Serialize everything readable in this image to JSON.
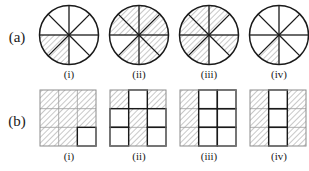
{
  "figure": {
    "kind": "fraction-shading-diagram",
    "background_color": "#ffffff",
    "stroke_color": "#1a1a1a",
    "hatch_color": "#9a9a9a",
    "rows": [
      {
        "label": "(a)",
        "shape": "circle",
        "total_parts": 8,
        "items": [
          {
            "caption": "(i)",
            "shaded_parts": 2,
            "fraction": "2/8",
            "shaded_sectors": [
              4,
              5
            ]
          },
          {
            "caption": "(ii)",
            "shaded_parts": 7,
            "fraction": "7/8",
            "shaded_sectors": [
              0,
              1,
              2,
              3,
              5,
              6,
              7
            ]
          },
          {
            "caption": "(iii)",
            "shaded_parts": 6,
            "fraction": "6/8",
            "shaded_sectors": [
              1,
              2,
              3,
              4,
              5,
              7
            ]
          },
          {
            "caption": "(iv)",
            "shaded_parts": 1,
            "fraction": "1/8",
            "shaded_sectors": [
              5
            ]
          }
        ]
      },
      {
        "label": "(b)",
        "shape": "square-grid",
        "grid_rows": 3,
        "grid_cols": 3,
        "total_parts": 9,
        "items": [
          {
            "caption": "(i)",
            "shaded_parts": 8,
            "fraction": "8/9",
            "shaded_cells": [
              0,
              1,
              2,
              3,
              4,
              5,
              6,
              7
            ]
          },
          {
            "caption": "(ii)",
            "shaded_parts": 4,
            "fraction": "4/9",
            "shaded_cells": [
              0,
              2,
              4,
              7
            ]
          },
          {
            "caption": "(iii)",
            "shaded_parts": 3,
            "fraction": "3/9",
            "shaded_cells": [
              0,
              3,
              6
            ]
          },
          {
            "caption": "(iv)",
            "shaded_parts": 6,
            "fraction": "6/9",
            "shaded_cells": [
              0,
              2,
              3,
              5,
              6,
              8
            ]
          }
        ]
      }
    ]
  }
}
